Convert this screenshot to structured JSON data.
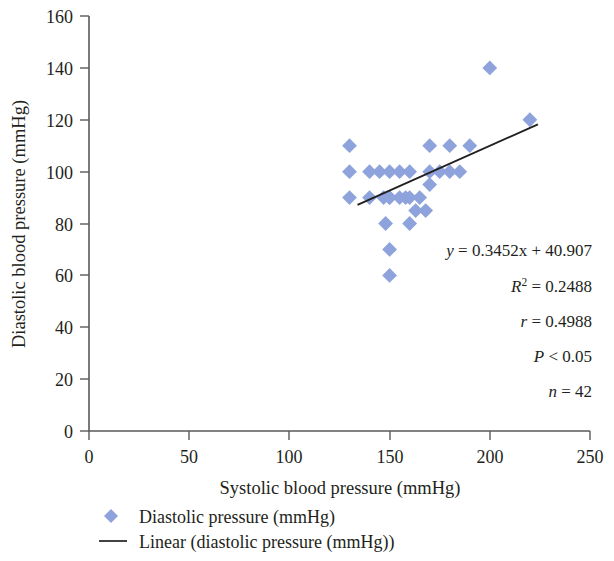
{
  "chart_data": {
    "type": "scatter",
    "title": "",
    "xlabel": "Systolic blood pressure (mmHg)",
    "ylabel": "Diastolic blood pressure (mmHg)",
    "xlim": [
      0,
      250
    ],
    "ylim": [
      0,
      160
    ],
    "xticks": [
      "0",
      "50",
      "100",
      "150",
      "200",
      "250"
    ],
    "yticks": [
      "0",
      "20",
      "40",
      "60",
      "80",
      "100",
      "120",
      "140",
      "160"
    ],
    "xtick_values": [
      0,
      50,
      100,
      150,
      200,
      250
    ],
    "ytick_values": [
      0,
      20,
      40,
      60,
      80,
      100,
      120,
      140,
      160
    ],
    "grid": false,
    "legend_position": "bottom-left",
    "marker": "diamond",
    "marker_color": "#8ea3dc",
    "trendline_color": "#231f20",
    "series": [
      {
        "name": "Diastolic pressure (mmHg)",
        "type": "scatter",
        "points": [
          [
            130,
            110
          ],
          [
            130,
            100
          ],
          [
            130,
            90
          ],
          [
            140,
            100
          ],
          [
            140,
            90
          ],
          [
            145,
            100
          ],
          [
            147,
            90
          ],
          [
            148,
            80
          ],
          [
            150,
            100
          ],
          [
            150,
            90
          ],
          [
            150,
            90
          ],
          [
            150,
            70
          ],
          [
            150,
            60
          ],
          [
            155,
            100
          ],
          [
            155,
            90
          ],
          [
            158,
            90
          ],
          [
            160,
            100
          ],
          [
            160,
            90
          ],
          [
            160,
            80
          ],
          [
            163,
            85
          ],
          [
            165,
            90
          ],
          [
            168,
            85
          ],
          [
            170,
            110
          ],
          [
            170,
            100
          ],
          [
            170,
            95
          ],
          [
            175,
            100
          ],
          [
            180,
            110
          ],
          [
            180,
            100
          ],
          [
            185,
            100
          ],
          [
            190,
            110
          ],
          [
            200,
            140
          ],
          [
            220,
            120
          ]
        ]
      },
      {
        "name": "Linear (diastolic pressure (mmHg))",
        "type": "line",
        "slope": 0.3452,
        "intercept": 40.907,
        "x_range": [
          134,
          224
        ]
      }
    ],
    "annotations": [
      {
        "id": "regression-equation",
        "text": "y = 0.3452x + 40.907"
      },
      {
        "id": "r-squared",
        "text": "R2 = 0.2488",
        "base": "R",
        "exponent": "2",
        "value": " = 0.2488"
      },
      {
        "id": "correlation",
        "text": "r = 0.4988"
      },
      {
        "id": "p-value",
        "text": "P < 0.05"
      },
      {
        "id": "sample-size",
        "text": "n = 42"
      }
    ],
    "statistics": {
      "slope": 0.3452,
      "intercept": 40.907,
      "r_squared": 0.2488,
      "r": 0.4988,
      "p": "< 0.05",
      "n": 42
    }
  },
  "axes": {
    "y_title": "Diastolic blood pressure (mmHg)",
    "x_title": "Systolic blood pressure (mmHg)",
    "y_ticks": [
      "160",
      "140",
      "120",
      "100",
      "80",
      "60",
      "40",
      "20",
      "0"
    ],
    "x_ticks": [
      "0",
      "50",
      "100",
      "150",
      "200",
      "250"
    ]
  },
  "annotation_block": {
    "equation_y": "y",
    "equation_rest": " = 0.3452x + 40.907",
    "equation_full": "y = 0.3452x + 40.907",
    "r2_symbol": "R",
    "r2_exponent": "2",
    "r2_value": " = 0.2488",
    "r_symbol": "r",
    "r_value": " = 0.4988",
    "p_symbol": "P",
    "p_value": " < 0.05",
    "n_symbol": "n",
    "n_value": " = 42"
  },
  "legend": {
    "items": [
      {
        "marker": "diamond-marker",
        "label": "Diastolic pressure (mmHg)",
        "color": "#8ea3dc"
      },
      {
        "marker": "line-marker",
        "label": "Linear (diastolic pressure (mmHg))",
        "color": "#231f20"
      }
    ]
  }
}
